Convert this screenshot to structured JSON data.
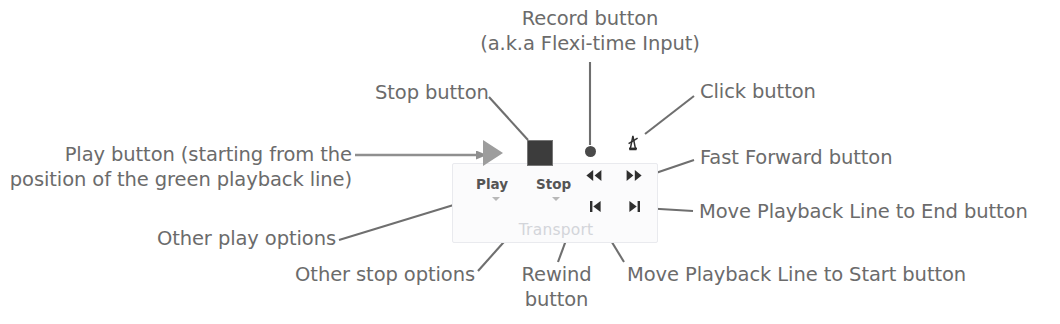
{
  "diagram": {
    "colors": {
      "label_text": "#6b6b6b",
      "leader_line": "#6f6f6f",
      "panel_bg": "#fbfbfc",
      "panel_border": "#e9eaee",
      "group_label": "#d3d5da",
      "play_icon": "#9d9d9d",
      "stop_icon": "#3c3c3c",
      "record_icon": "#4a4a4a",
      "transport_glyph": "#2f2f2f"
    }
  },
  "annotations": {
    "record": {
      "line1": "Record button",
      "line2": "(a.k.a Flexi-time Input)"
    },
    "stop": "Stop button",
    "click": "Click button",
    "play": {
      "line1": "Play button (starting from the",
      "line2": "position of the green playback line)"
    },
    "fast_forward": "Fast Forward button",
    "move_to_end": "Move Playback Line to End button",
    "other_play_options": "Other play options",
    "other_stop_options": "Other stop options",
    "rewind": {
      "line1": "Rewind",
      "line2": "button"
    },
    "move_to_start": "Move Playback Line to Start button"
  },
  "toolbar": {
    "group_label": "Transport",
    "play_label": "Play",
    "stop_label": "Stop",
    "buttons": [
      {
        "name": "play",
        "icon": "play-triangle-icon",
        "label": "Play",
        "has_dropdown": true
      },
      {
        "name": "stop",
        "icon": "stop-square-icon",
        "label": "Stop",
        "has_dropdown": true
      },
      {
        "name": "record",
        "icon": "record-dot-icon",
        "label": "",
        "has_dropdown": false
      },
      {
        "name": "click",
        "icon": "metronome-click-icon",
        "label": "",
        "has_dropdown": false
      },
      {
        "name": "rewind",
        "icon": "rewind-icon",
        "glyph": "⏪",
        "label": "",
        "has_dropdown": false
      },
      {
        "name": "fast-forward",
        "icon": "fast-forward-icon",
        "glyph": "⏩",
        "label": "",
        "has_dropdown": false
      },
      {
        "name": "move-to-start",
        "icon": "skip-to-start-icon",
        "glyph": "⏮",
        "label": "",
        "has_dropdown": false
      },
      {
        "name": "move-to-end",
        "icon": "skip-to-end-icon",
        "glyph": "⏭",
        "label": "",
        "has_dropdown": false
      }
    ]
  }
}
